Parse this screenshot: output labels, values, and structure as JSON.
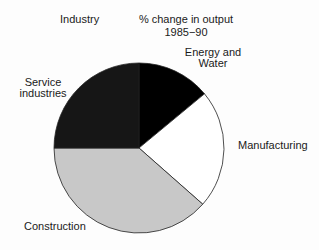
{
  "chart_data": {
    "type": "pie",
    "title_line1": "% change in output",
    "title_line2": "1985−90",
    "category_header": "Industry",
    "categories": [
      "Energy and Water",
      "Manufacturing",
      "Construction",
      "Service industries"
    ],
    "values": [
      14,
      22.5,
      38.5,
      25
    ],
    "colors": [
      "#000000",
      "#ffffff",
      "#c8c8c8",
      "#161616"
    ],
    "label_lines": {
      "energy": [
        "Energy and",
        "Water"
      ],
      "manufacturing": [
        "Manufacturing"
      ],
      "construction": [
        "Construction"
      ],
      "service": [
        "Service",
        "industries"
      ]
    }
  }
}
